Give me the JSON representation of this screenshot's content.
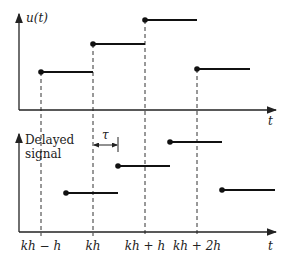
{
  "diagram": {
    "top_plot": {
      "y_label": "u(t)",
      "x_label": "t",
      "steps": [
        {
          "x_start": 41,
          "x_end": 93,
          "y": 72
        },
        {
          "x_start": 93,
          "x_end": 145,
          "y": 44
        },
        {
          "x_start": 145,
          "x_end": 197,
          "y": 20
        },
        {
          "x_start": 197,
          "x_end": 250,
          "y": 69
        }
      ]
    },
    "bottom_plot": {
      "y_label_line1": "Delayed",
      "y_label_line2": "signal",
      "x_label": "t",
      "delay_label": "τ",
      "steps": [
        {
          "x_start": 66,
          "x_end": 118,
          "y": 193
        },
        {
          "x_start": 118,
          "x_end": 170,
          "y": 166
        },
        {
          "x_start": 170,
          "x_end": 222,
          "y": 142
        },
        {
          "x_start": 222,
          "x_end": 275,
          "y": 190
        }
      ]
    },
    "tick_labels": [
      {
        "x": 41,
        "text": "kh − h"
      },
      {
        "x": 93,
        "text": "kh"
      },
      {
        "x": 145,
        "text": "kh + h"
      },
      {
        "x": 197,
        "text": "kh + 2h"
      }
    ]
  }
}
